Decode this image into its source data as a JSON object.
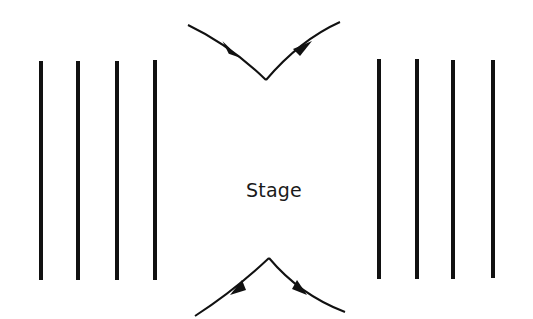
{
  "diagram": {
    "label": "Stage",
    "colors": {
      "stroke": "#111111",
      "background": "#ffffff"
    },
    "left_lines": [
      {
        "x": 41,
        "y1": 61,
        "y2": 280
      },
      {
        "x": 78,
        "y1": 61,
        "y2": 280
      },
      {
        "x": 117,
        "y1": 61,
        "y2": 280
      },
      {
        "x": 155,
        "y1": 60,
        "y2": 280
      }
    ],
    "right_lines": [
      {
        "x": 379,
        "y1": 59,
        "y2": 279
      },
      {
        "x": 417,
        "y1": 59,
        "y2": 279
      },
      {
        "x": 453,
        "y1": 60,
        "y2": 279
      },
      {
        "x": 493,
        "y1": 60,
        "y2": 278
      }
    ],
    "top_path": {
      "start": [
        188,
        25
      ],
      "vertex": [
        266,
        80
      ],
      "end": [
        340,
        22
      ],
      "arrows": [
        "incoming",
        "outgoing"
      ]
    },
    "bottom_path": {
      "start": [
        195,
        316
      ],
      "vertex": [
        269,
        258
      ],
      "end": [
        345,
        312
      ],
      "arrows": [
        "outgoing-left",
        "outgoing-right"
      ]
    }
  }
}
